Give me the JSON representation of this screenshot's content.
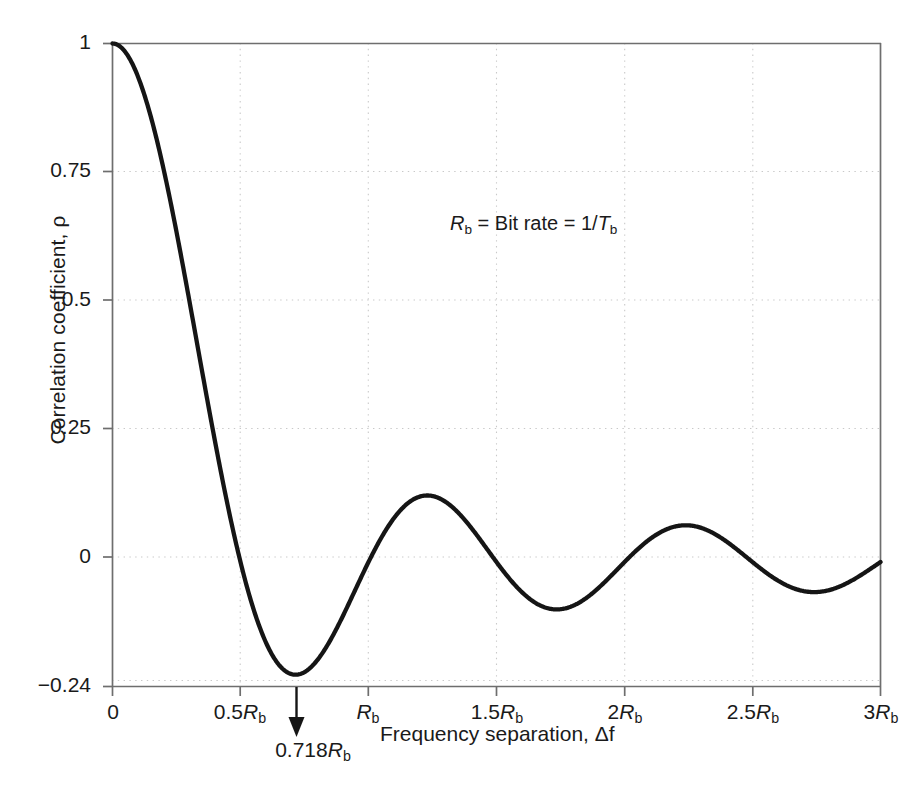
{
  "chart_data": {
    "type": "line",
    "title": "",
    "xlabel": "Frequency separation, Δf",
    "ylabel": "Correlation coefficient, ρ",
    "xlim": [
      0,
      3
    ],
    "ylim": [
      -0.24,
      1
    ],
    "grid": true,
    "legend": null,
    "x_unit": "R_b",
    "xticks": [
      0,
      0.5,
      1,
      1.5,
      2,
      2.5,
      3
    ],
    "xticklabels": [
      "0",
      "0.5Rᵇ",
      "Rᵇ",
      "1.5Rᵇ",
      "2Rᵇ",
      "2.5Rᵇ",
      "3Rᵇ"
    ],
    "yticks": [
      -0.24,
      0,
      0.25,
      0.5,
      0.75,
      1
    ],
    "yticklabels": [
      "−0.24",
      "0",
      "0.25",
      "0.5",
      "0.75",
      "1"
    ],
    "series": [
      {
        "name": "rho",
        "formula": "sin(2*pi*x)/(2*pi*x)",
        "x": [
          0,
          0.1,
          0.2,
          0.3,
          0.4,
          0.5,
          0.6,
          0.7,
          0.718,
          0.8,
          0.9,
          1.0,
          1.1,
          1.2,
          1.25,
          1.3,
          1.4,
          1.5,
          1.6,
          1.7,
          1.75,
          1.8,
          1.9,
          2.0,
          2.1,
          2.2,
          2.25,
          2.3,
          2.4,
          2.5,
          2.6,
          2.7,
          2.75,
          2.8,
          2.9,
          3.0
        ],
        "y": [
          1.0,
          0.935,
          0.757,
          0.505,
          0.234,
          0.0,
          -0.156,
          -0.212,
          -0.217,
          -0.189,
          -0.069,
          0.0,
          0.083,
          0.131,
          0.148,
          0.136,
          0.07,
          0.0,
          -0.061,
          -0.109,
          -0.113,
          -0.106,
          -0.049,
          0.0,
          0.047,
          0.082,
          0.087,
          0.08,
          0.04,
          0.0,
          -0.037,
          -0.066,
          -0.071,
          -0.064,
          -0.031,
          0.0
        ]
      }
    ],
    "annotations": [
      {
        "name": "bit-rate-note",
        "text": "Rᵇ = Bit rate = 1/Tᵇ",
        "x": 1.32,
        "y": 0.62
      },
      {
        "name": "minimum-marker",
        "text": "0.718Rᵇ",
        "x": 0.718,
        "y": -0.24,
        "marker": "down-arrow"
      }
    ]
  },
  "axes": {
    "y_ticks": [
      {
        "label": "1",
        "value": 1
      },
      {
        "label": "0.75",
        "value": 0.75
      },
      {
        "label": "0.5",
        "value": 0.5
      },
      {
        "label": "0.25",
        "value": 0.25
      },
      {
        "label": "0",
        "value": 0
      },
      {
        "label": "−0.24",
        "value": -0.24
      }
    ],
    "x_ticks": [
      {
        "label": "0",
        "value": 0,
        "italic_r": false
      },
      {
        "label": "0.5",
        "value": 0.5,
        "italic_r": true
      },
      {
        "label": "",
        "value": 1,
        "italic_r": true
      },
      {
        "label": "1.5",
        "value": 1.5,
        "italic_r": true
      },
      {
        "label": "2",
        "value": 2,
        "italic_r": true
      },
      {
        "label": "2.5",
        "value": 2.5,
        "italic_r": true
      },
      {
        "label": "3",
        "value": 3,
        "italic_r": true
      }
    ]
  },
  "labels": {
    "y_axis_title": "Correlation coefficient, ρ",
    "x_axis_title": "Frequency separation, Δf",
    "arrow_value": "0.718",
    "note_prefix": "R",
    "note_body": " = Bit rate = 1/"
  },
  "colors": {
    "curve": "#151515",
    "axis": "#6e6e6e",
    "grid": "#c9c9c9",
    "text": "#1a1a1a",
    "background": "#ffffff"
  }
}
